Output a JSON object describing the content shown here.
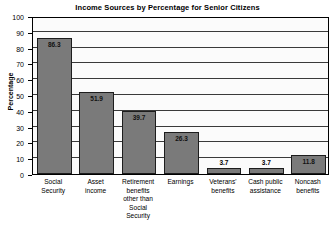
{
  "chart_data": {
    "type": "bar",
    "title": "Income Sources by Percentage for Senior Citizens",
    "xlabel": "",
    "ylabel": "Percentage",
    "ylim": [
      0,
      100
    ],
    "yticks": [
      0,
      10,
      20,
      30,
      40,
      50,
      60,
      70,
      80,
      90,
      100
    ],
    "grid": true,
    "legend": false,
    "categories": [
      "Social Security",
      "Asset income",
      "Retirement benefits other than Social Security",
      "Earnings",
      "Veterans' benefits",
      "Cash public assistance",
      "Noncash benefits"
    ],
    "category_lines": [
      [
        "Social",
        "Security"
      ],
      [
        "Asset",
        "income"
      ],
      [
        "Retirement",
        "benefits",
        "other than",
        "Social Security"
      ],
      [
        "Earnings"
      ],
      [
        "Veterans'",
        "benefits"
      ],
      [
        "Cash public",
        "assistance"
      ],
      [
        "Noncash",
        "benefits"
      ]
    ],
    "values": [
      86.3,
      51.9,
      39.7,
      26.3,
      3.7,
      3.7,
      11.8
    ],
    "value_labels": [
      "86.3",
      "51.9",
      "39.7",
      "26.3",
      "3.7",
      "3.7",
      "11.8"
    ],
    "colors": {
      "bar_fill": "#7a7a7a",
      "bar_stroke": "#1d1d1d",
      "plot_background": "#fbfbfb",
      "grid": "#3a3a3a",
      "axis": "#000000",
      "text": "#000000"
    }
  }
}
